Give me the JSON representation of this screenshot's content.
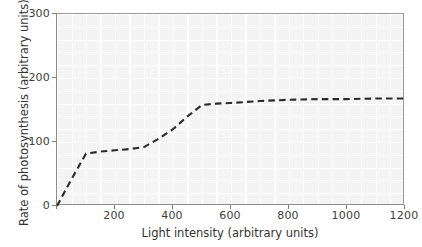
{
  "chart_data": {
    "type": "line",
    "title": "",
    "xlabel": "Light intensity (arbitrary units)",
    "ylabel": "Rate of photosynthesis (arbitrary units)",
    "xlim": [
      0,
      1200
    ],
    "ylim": [
      0,
      300
    ],
    "xticks": [
      0,
      200,
      400,
      600,
      800,
      1000,
      1200
    ],
    "xticklabels": [
      "",
      "200",
      "400",
      "600",
      "800",
      "1000",
      "1200"
    ],
    "yticks": [
      0,
      100,
      200,
      300
    ],
    "yticklabels": [
      "0",
      "100",
      "200",
      "300"
    ],
    "grid": true,
    "grid_color": "#ffffff",
    "plot_background": "#f4f4f4",
    "legend": null,
    "series": [
      {
        "name": "Rate of photosynthesis",
        "linestyle": "dashed",
        "color": "#2b2b2b",
        "x": [
          0,
          50,
          100,
          150,
          200,
          250,
          300,
          350,
          400,
          450,
          500,
          550,
          600,
          700,
          800,
          900,
          1000,
          1100,
          1200
        ],
        "y": [
          0,
          42,
          82,
          85,
          87,
          89,
          92,
          105,
          120,
          140,
          158,
          160,
          161,
          164,
          166,
          167,
          167,
          168,
          168
        ]
      }
    ],
    "annotations": []
  },
  "axis": {
    "x_tick_labels": [
      "200",
      "400",
      "600",
      "800",
      "1000",
      "1200"
    ],
    "y_tick_labels": [
      "300",
      "200",
      "100",
      "0"
    ]
  }
}
